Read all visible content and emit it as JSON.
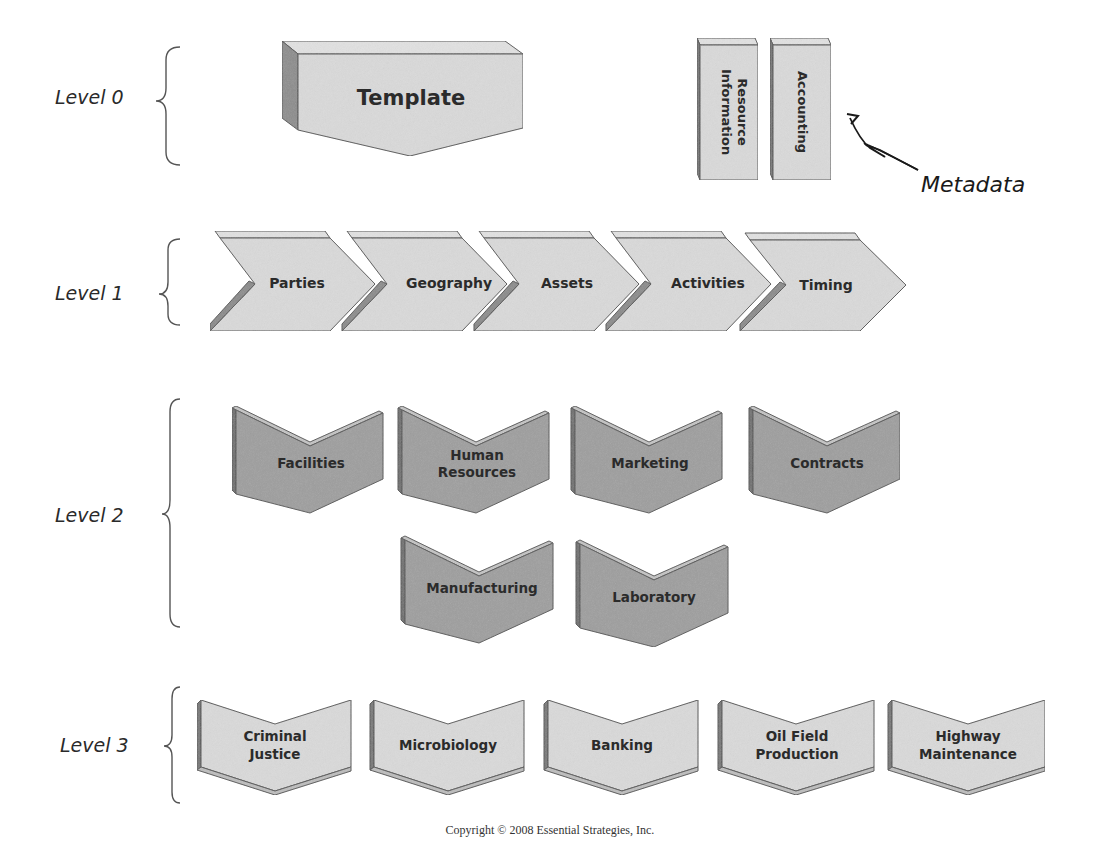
{
  "diagram": {
    "levels": [
      {
        "label": "Level 0"
      },
      {
        "label": "Level 1"
      },
      {
        "label": "Level 2"
      },
      {
        "label": "Level 3"
      }
    ],
    "level0": {
      "template_label": "Template",
      "metadata_boxes": [
        {
          "line1": "Information",
          "line2": "Resource"
        },
        {
          "line1": "Accounting"
        }
      ],
      "metadata_label": "Metadata"
    },
    "level1": {
      "items": [
        {
          "label": "Parties"
        },
        {
          "label": "Geography"
        },
        {
          "label": "Assets"
        },
        {
          "label": "Activities"
        },
        {
          "label": "Timing"
        }
      ]
    },
    "level2": {
      "items": [
        {
          "line1": "Facilities"
        },
        {
          "line1": "Human",
          "line2": "Resources"
        },
        {
          "line1": "Marketing"
        },
        {
          "line1": "Contracts"
        },
        {
          "line1": "Manufacturing"
        },
        {
          "line1": "Laboratory"
        }
      ]
    },
    "level3": {
      "items": [
        {
          "line1": "Criminal",
          "line2": "Justice"
        },
        {
          "line1": "Microbiology"
        },
        {
          "line1": "Banking"
        },
        {
          "line1": "Oil Field",
          "line2": "Production"
        },
        {
          "line1": "Highway",
          "line2": "Maintenance"
        }
      ]
    },
    "colors": {
      "light_fill": "#d9d9d9",
      "dark_fill": "#9e9e9e",
      "side_fill": "#8a8a8a",
      "top_fill": "#e4e4e4",
      "stroke": "#555555"
    }
  },
  "footer": {
    "copyright": "Copyright © 2008 Essential Strategies, Inc."
  }
}
